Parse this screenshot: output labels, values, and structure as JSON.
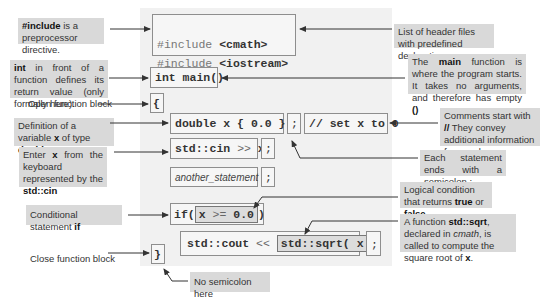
{
  "code": {
    "include_cmath_pre": "#include ",
    "include_cmath_hdr": "<cmath>",
    "include_iostream_pre": "#include ",
    "include_iostream_hdr": "<iostream>",
    "main_signature": "int main()",
    "open_brace": "{",
    "double_def": "double x { 0.0 }",
    "semicolon": ";",
    "comment": "// set x to 0",
    "cin_stmt_a": "std::cin ",
    "cin_stmt_op": ">>",
    "cin_stmt_b": " x",
    "another_statement": "another_statement",
    "if_kw": "if(",
    "if_condition_a": "x ",
    "if_condition_op": ">=",
    "if_condition_b": " 0.0",
    "if_close": ")",
    "cout_a": "std::cout ",
    "cout_op": "<<",
    "sqrt_call": "std::sqrt( x )",
    "close_brace": "}"
  },
  "notes": {
    "include": {
      "bold": "#include",
      "text": " is a preprocessor directive."
    },
    "int_ret": {
      "bold": "int",
      "text": " in front of a function defines its return value (only formally here)."
    },
    "open_block": "Open function block",
    "var_def": {
      "text": "Definition of a variable ",
      "bold1": "x",
      "text2": " of type ",
      "bold2": "double"
    },
    "enter_x": {
      "text": "Enter ",
      "bold1": "x",
      "text2": " from the keyboard represented by the ",
      "bold2": "std::cin"
    },
    "conditional": {
      "text": "Conditional statement ",
      "bold": "if"
    },
    "close_block": "Close function block",
    "headers": "List of header files with predefined declarations.",
    "main_fn": {
      "text": "The ",
      "bold": "main",
      "text2": " function is where the program starts. It takes no arguments, and therefore has empty ",
      "bold2": "()"
    },
    "comments": {
      "text": "Comments start with ",
      "bold": "//",
      "text2": " They convey additional information for people."
    },
    "semicolon_note": "Each statement ends with a semicolon ;",
    "logical": {
      "text": "Logical condition that returns ",
      "bold1": "true",
      "text2": " or ",
      "bold2": "false",
      "text3": "."
    },
    "sqrt_note": {
      "text": "A function ",
      "bold1": "std::sqrt",
      "text2": ", declared in ",
      "ital": "cmath",
      "text3": ", is called to compute the square root of ",
      "bold2": "x",
      "text4": "."
    },
    "no_semicolon": "No semicolon here"
  },
  "colors": {
    "panel": "#f1f1f1",
    "note_shade": "#d9d9d9",
    "box_border": "#8e8e8e",
    "arrow": "#333333"
  }
}
